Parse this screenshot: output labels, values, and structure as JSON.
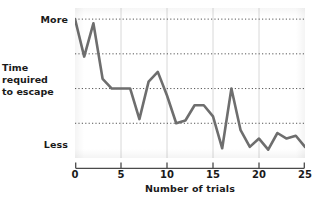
{
  "chart_data": {
    "type": "line",
    "title": "",
    "xlabel": "Number of trials",
    "ylabel": "Time required to escape",
    "ylabel_lines": [
      "Time",
      "required",
      "to escape"
    ],
    "xticks": [
      0,
      5,
      10,
      15,
      20,
      25
    ],
    "xticklabels": [
      "0",
      "5",
      "10",
      "15",
      "20",
      "25"
    ],
    "xlim": [
      0,
      25
    ],
    "ylim": [
      0,
      108
    ],
    "yticklabels": [
      "More",
      "Less"
    ],
    "ytick_more": "More",
    "ytick_less": "Less",
    "grid": "horizontal-dotted-and-faint-vertical",
    "gridlines_y": [
      100,
      75,
      50,
      25
    ],
    "gridlines_x": [
      5,
      10,
      15,
      20
    ],
    "legend": "none",
    "line_color": "#6e6e6e",
    "line_width": 2.6,
    "series": [
      {
        "name": "Time required to escape",
        "x": [
          0,
          1,
          2,
          3,
          4,
          5,
          6,
          7,
          8,
          9,
          10,
          11,
          12,
          13,
          14,
          15,
          16,
          17,
          18,
          19,
          20,
          21,
          22,
          23,
          24,
          25
        ],
        "values": [
          100,
          73,
          97,
          57,
          50,
          50,
          50,
          28,
          55,
          62,
          45,
          25,
          27,
          38,
          38,
          30,
          7,
          50,
          20,
          8,
          14,
          6,
          18,
          14,
          16,
          8
        ]
      }
    ]
  },
  "axis": {
    "x_title": "Number of trials",
    "y_title_line1": "Time",
    "y_title_line2": "required",
    "y_title_line3": "to escape",
    "y_top_label": "More",
    "y_bottom_label": "Less"
  },
  "colors": {
    "line": "#6e6e6e",
    "grid": "#555555",
    "text": "#1a1a1a",
    "axis": "#4a4a4a",
    "background": "#ffffff"
  }
}
